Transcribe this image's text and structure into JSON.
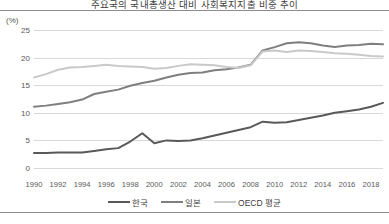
{
  "chart_title": "주요국의 국내총생산 대비 사회복지지출 비중 추이",
  "axis": {
    "y_unit_label": "(%)",
    "y_ticks": [
      25,
      20,
      15,
      10,
      5,
      0
    ],
    "x_ticks": [
      1990,
      1992,
      1994,
      1996,
      1998,
      2000,
      2002,
      2004,
      2006,
      2008,
      2010,
      2012,
      2014,
      2016,
      2018
    ]
  },
  "legend": {
    "items": [
      {
        "label": "한국",
        "color": "#595959"
      },
      {
        "label": "일본",
        "color": "#7f7f7f"
      },
      {
        "label": "OECD 평균",
        "color": "#c9c9c9"
      }
    ]
  },
  "colors": {
    "korea": "#595959",
    "japan": "#7f7f7f",
    "oecd": "#c9c9c9",
    "gridline": "#d9d9d9",
    "rule": "#8c8c8c",
    "text": "#595959"
  },
  "chart_data": {
    "type": "line",
    "title": "주요국의 국내총생산 대비 사회복지지출 비중 추이",
    "xlabel": "",
    "ylabel": "(%)",
    "ylim": [
      0,
      25
    ],
    "xlim": [
      1990,
      2019
    ],
    "grid": true,
    "legend_position": "bottom",
    "x": [
      1990,
      1991,
      1992,
      1993,
      1994,
      1995,
      1996,
      1997,
      1998,
      1999,
      2000,
      2001,
      2002,
      2003,
      2004,
      2005,
      2006,
      2007,
      2008,
      2009,
      2010,
      2011,
      2012,
      2013,
      2014,
      2015,
      2016,
      2017,
      2018,
      2019
    ],
    "series": [
      {
        "name": "한국",
        "color": "#595959",
        "values": [
          2.7,
          2.7,
          2.8,
          2.8,
          2.8,
          3.1,
          3.4,
          3.6,
          4.8,
          6.3,
          4.5,
          5.0,
          4.9,
          5.0,
          5.4,
          5.9,
          6.4,
          6.9,
          7.4,
          8.4,
          8.2,
          8.3,
          8.7,
          9.1,
          9.5,
          10.0,
          10.3,
          10.6,
          11.1,
          11.8
        ]
      },
      {
        "name": "일본",
        "color": "#7f7f7f",
        "values": [
          11.1,
          11.3,
          11.6,
          11.9,
          12.4,
          13.4,
          13.8,
          14.2,
          14.9,
          15.4,
          15.8,
          16.4,
          16.9,
          17.2,
          17.3,
          17.7,
          17.9,
          18.2,
          18.7,
          21.3,
          21.9,
          22.6,
          22.8,
          22.6,
          22.2,
          21.9,
          22.2,
          22.3,
          22.5,
          22.4
        ]
      },
      {
        "name": "OECD 평균",
        "color": "#c9c9c9",
        "values": [
          16.4,
          17.0,
          17.8,
          18.2,
          18.3,
          18.5,
          18.7,
          18.5,
          18.4,
          18.3,
          18.0,
          18.1,
          18.5,
          18.8,
          18.7,
          18.6,
          18.3,
          18.1,
          18.6,
          21.1,
          21.3,
          21.0,
          21.3,
          21.2,
          21.0,
          20.8,
          20.7,
          20.5,
          20.3,
          20.2
        ]
      }
    ]
  }
}
